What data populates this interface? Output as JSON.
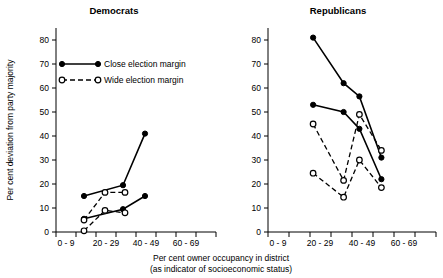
{
  "figure": {
    "xlabel_line1": "Per cent owner occupancy in district",
    "xlabel_line2": "(as indicator of socioeconomic status)",
    "ylabel": "Per cent deviation from party majority",
    "legend": [
      {
        "label": "Close election margin",
        "style": "solid-filled"
      },
      {
        "label": "Wide election margin",
        "style": "dashed-open"
      }
    ]
  },
  "chart_data": [
    {
      "type": "line",
      "title": "Democrats",
      "xlabel": "Per cent owner occupancy in district (as indicator of socioeconomic status)",
      "ylabel": "Per cent deviation from party majority",
      "ylim": [
        0,
        85
      ],
      "yticks": [
        0,
        10,
        20,
        30,
        40,
        50,
        60,
        70,
        80
      ],
      "ytick_labels": [
        "0",
        "10",
        "20",
        "30",
        "40",
        "50",
        "60",
        "70",
        "80"
      ],
      "xlim": [
        0,
        7
      ],
      "xtick_labels": [
        "0 - 9",
        "20 - 29",
        "40 - 49",
        "60 - 69"
      ],
      "xtick_label_positions": [
        0.5,
        2.5,
        4.5,
        6.5
      ],
      "xticks": [
        0,
        1,
        2,
        3,
        4,
        5,
        6,
        7
      ],
      "grid": false,
      "legend_position": "upper-left",
      "series": [
        {
          "name": "Close election margin A",
          "style": "solid-filled",
          "x": [
            1.4,
            3.35,
            4.45
          ],
          "values": [
            15.0,
            19.5,
            41.0
          ]
        },
        {
          "name": "Close election margin B",
          "style": "solid-filled",
          "x": [
            1.4,
            3.35,
            4.45
          ],
          "values": [
            5.5,
            9.5,
            15.0
          ]
        },
        {
          "name": "Wide election margin A",
          "style": "dashed-open",
          "x": [
            1.4,
            2.45,
            3.45
          ],
          "values": [
            5.0,
            16.5,
            16.5
          ]
        },
        {
          "name": "Wide election margin B",
          "style": "dashed-open",
          "x": [
            1.4,
            2.45,
            3.45
          ],
          "values": [
            0.5,
            9.0,
            8.0
          ]
        }
      ]
    },
    {
      "type": "line",
      "title": "Republicans",
      "xlabel": "Per cent owner occupancy in district (as indicator of socioeconomic status)",
      "ylabel": "Per cent deviation from party majority",
      "ylim": [
        0,
        85
      ],
      "yticks": [
        0,
        10,
        20,
        30,
        40,
        50,
        60,
        70,
        80
      ],
      "ytick_labels": [
        "0",
        "10",
        "20",
        "30",
        "40",
        "50",
        "60",
        "70",
        "80"
      ],
      "xlim": [
        0,
        7
      ],
      "xtick_labels": [
        "0 - 9",
        "20 - 29",
        "40 - 49",
        "60 - 69"
      ],
      "xtick_label_positions": [
        0.5,
        2.5,
        4.5,
        6.5
      ],
      "xticks": [
        0,
        1,
        2,
        3,
        4,
        5,
        6,
        7
      ],
      "grid": false,
      "legend_position": "none",
      "series": [
        {
          "name": "Close election margin A",
          "style": "solid-filled",
          "x": [
            2.15,
            3.6,
            4.35,
            5.4
          ],
          "values": [
            81.0,
            62.0,
            56.5,
            31.0
          ]
        },
        {
          "name": "Close election margin B",
          "style": "solid-filled",
          "x": [
            2.15,
            3.6,
            4.35,
            5.4
          ],
          "values": [
            53.0,
            50.0,
            43.0,
            22.0
          ]
        },
        {
          "name": "Wide election margin A",
          "style": "dashed-open",
          "x": [
            2.15,
            3.6,
            4.35,
            5.4
          ],
          "values": [
            45.0,
            21.5,
            49.0,
            34.0
          ]
        },
        {
          "name": "Wide election margin B",
          "style": "dashed-open",
          "x": [
            2.15,
            3.6,
            4.35,
            5.4
          ],
          "values": [
            24.5,
            14.5,
            30.0,
            18.5
          ]
        }
      ]
    }
  ]
}
